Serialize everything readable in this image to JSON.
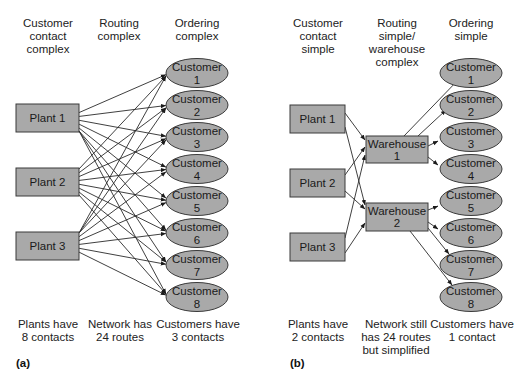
{
  "panel_a": {
    "tag": "(a)",
    "headers": [
      {
        "lines": [
          "Customer",
          "contact",
          "complex"
        ]
      },
      {
        "lines": [
          "Routing",
          "complex"
        ]
      },
      {
        "lines": [
          "Ordering",
          "complex"
        ]
      }
    ],
    "footers": [
      {
        "lines": [
          "Plants have",
          "8 contacts"
        ]
      },
      {
        "lines": [
          "Network has",
          "24 routes"
        ]
      },
      {
        "lines": [
          "Customers have",
          "3 contacts"
        ]
      }
    ],
    "plants": [
      "Plant 1",
      "Plant 2",
      "Plant 3"
    ],
    "customers": [
      {
        "l1": "Customer",
        "l2": "1"
      },
      {
        "l1": "Customer",
        "l2": "2"
      },
      {
        "l1": "Customer",
        "l2": "3"
      },
      {
        "l1": "Customer",
        "l2": "4"
      },
      {
        "l1": "Customer",
        "l2": "5"
      },
      {
        "l1": "Customer",
        "l2": "6"
      },
      {
        "l1": "Customer",
        "l2": "7"
      },
      {
        "l1": "Customer",
        "l2": "8"
      }
    ]
  },
  "panel_b": {
    "tag": "(b)",
    "headers": [
      {
        "lines": [
          "Customer",
          "contact",
          "simple"
        ]
      },
      {
        "lines": [
          "Routing",
          "simple/",
          "warehouse",
          "complex"
        ]
      },
      {
        "lines": [
          "Ordering",
          "simple"
        ]
      }
    ],
    "footers": [
      {
        "lines": [
          "Plants have",
          "2 contacts"
        ]
      },
      {
        "lines": [
          "Network still",
          "has 24 routes",
          "but simplified"
        ]
      },
      {
        "lines": [
          "Customers have",
          "1 contact"
        ]
      }
    ],
    "plants": [
      "Plant 1",
      "Plant 2",
      "Plant 3"
    ],
    "warehouses": [
      {
        "l1": "Warehouse",
        "l2": "1"
      },
      {
        "l1": "Warehouse",
        "l2": "2"
      }
    ],
    "customers": [
      {
        "l1": "Customer",
        "l2": "1"
      },
      {
        "l1": "Customer",
        "l2": "2"
      },
      {
        "l1": "Customer",
        "l2": "3"
      },
      {
        "l1": "Customer",
        "l2": "4"
      },
      {
        "l1": "Customer",
        "l2": "5"
      },
      {
        "l1": "Customer",
        "l2": "6"
      },
      {
        "l1": "Customer",
        "l2": "7"
      },
      {
        "l1": "Customer",
        "l2": "8"
      }
    ]
  },
  "colors": {
    "node_fill": "#a9a9a9",
    "node_stroke": "#3a3a3a",
    "edge": "#2a2a2a"
  }
}
